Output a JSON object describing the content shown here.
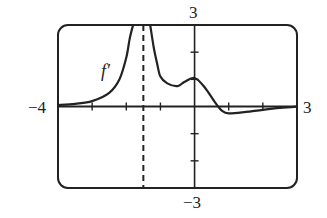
{
  "chart_data": {
    "type": "line",
    "title": "",
    "xlabel": "",
    "ylabel": "",
    "xlim": [
      -4,
      3
    ],
    "ylim": [
      -3,
      3
    ],
    "grid": false,
    "legend": null,
    "x_tick_step": 1,
    "y_tick_step": 1,
    "labels": {
      "x_min": "−4",
      "x_max": "3",
      "y_max": "3",
      "y_min": "−3"
    },
    "series": [
      {
        "name": "f′",
        "label": "f′",
        "x": [
          -4.0,
          -3.5,
          -3.0,
          -2.5,
          -2.2,
          -2.0,
          -1.9,
          -1.8,
          -1.5,
          -1.3,
          -1.2,
          -1.1,
          -1.0,
          -0.8,
          -0.5,
          -0.3,
          0.0,
          0.3,
          0.6,
          0.8,
          1.0,
          1.5,
          2.0,
          2.5,
          3.0
        ],
        "y": [
          0.05,
          0.1,
          0.2,
          0.5,
          1.0,
          1.8,
          2.5,
          3.0,
          null,
          3.0,
          2.2,
          1.6,
          1.1,
          0.85,
          0.75,
          0.9,
          1.05,
          0.7,
          0.15,
          -0.15,
          -0.25,
          -0.2,
          -0.12,
          -0.05,
          0.0
        ]
      }
    ],
    "annotations": [
      {
        "type": "vertical-asymptote",
        "style": "dashed",
        "x": -1.5
      },
      {
        "type": "text",
        "text": "f′",
        "x": -2.7,
        "y": 1.3
      }
    ]
  }
}
